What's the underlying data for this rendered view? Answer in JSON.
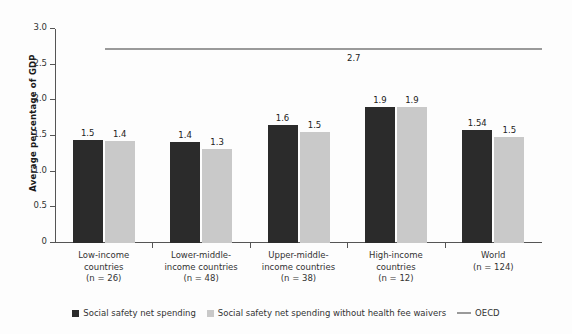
{
  "chart_data": {
    "type": "bar",
    "title": "",
    "xlabel": "",
    "ylabel": "Average percentage of GDP",
    "ylim": [
      0,
      3.0
    ],
    "ytick_values": [
      0,
      0.5,
      1.0,
      1.5,
      2.0,
      2.5,
      3.0
    ],
    "ytick_labels": [
      "0",
      "0.5",
      "1.0",
      "1.5",
      "2.0",
      "2.5",
      "3.0"
    ],
    "grid": false,
    "legend_position": "bottom",
    "categories": [
      "Low-income countries (n = 26)",
      "Lower-middle-income countries (n = 48)",
      "Upper-middle-income countries (n = 38)",
      "High-income countries (n = 12)",
      "World (n = 124)"
    ],
    "category_lines": [
      [
        "Low-income",
        "countries",
        "(n = 26)"
      ],
      [
        "Lower-middle-",
        "income countries",
        "(n = 48)"
      ],
      [
        "Upper-middle-",
        "income countries",
        "(n = 38)"
      ],
      [
        "High-income",
        "countries",
        "(n = 12)"
      ],
      [
        "World",
        "(n = 124)"
      ]
    ],
    "series": [
      {
        "name": "Social safety net spending",
        "color": "#2b2b2b",
        "values": [
          1.45,
          1.42,
          1.66,
          1.91,
          1.58
        ],
        "labels": [
          "1.5",
          "1.4",
          "1.6",
          "1.9",
          "1.54"
        ]
      },
      {
        "name": "Social safety net spending without health fee waivers",
        "color": "#c9c9c9",
        "values": [
          1.43,
          1.32,
          1.55,
          1.91,
          1.48
        ],
        "labels": [
          "1.4",
          "1.3",
          "1.5",
          "1.9",
          "1.5"
        ]
      }
    ],
    "reference_line": {
      "name": "OECD",
      "value": 2.7,
      "label": "2.7",
      "color": "#9a9a9a"
    }
  },
  "legend": {
    "items": [
      {
        "label": "Social safety net spending",
        "marker": "square-dark"
      },
      {
        "label": "Social safety net spending without health fee waivers",
        "marker": "square-light"
      },
      {
        "label": "OECD",
        "marker": "line"
      }
    ]
  }
}
